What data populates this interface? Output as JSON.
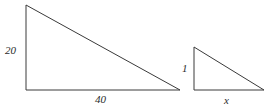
{
  "figure": {
    "background_color": "#ffffff",
    "stroke_color": "#3a3a3a",
    "text_color": "#2b2b2b",
    "stroke_width": 1
  },
  "shapes": {
    "large_triangle": {
      "name": "large-right-triangle",
      "vertices": {
        "apex": [
          26,
          5
        ],
        "bottom_left": [
          26,
          90
        ],
        "bottom_right": [
          180,
          90
        ]
      },
      "points_attr": "26,5 26,90 180,90",
      "labels": {
        "vertical_leg": "20",
        "horizontal_leg": "40"
      }
    },
    "small_triangle": {
      "name": "small-right-triangle",
      "vertices": {
        "apex": [
          194,
          47
        ],
        "bottom_left": [
          194,
          90
        ],
        "bottom_right": [
          264,
          90
        ]
      },
      "points_attr": "194,47 194,90 264,90",
      "labels": {
        "vertical_leg": "1",
        "horizontal_leg": "x"
      }
    }
  },
  "labels": {
    "large_vertical": "20",
    "large_horizontal": "40",
    "small_vertical": "1",
    "small_horizontal": "x"
  }
}
